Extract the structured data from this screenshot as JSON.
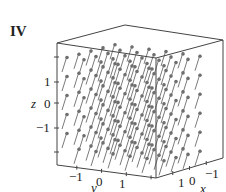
{
  "panel_label": "IV",
  "colors": {
    "edge": "#444444",
    "arrow": "#7a7a7a",
    "text": "#222222"
  },
  "cube": {
    "top_left": [
      57,
      43
    ],
    "top_back": [
      125,
      25
    ],
    "top_right": [
      223,
      40
    ],
    "top_front": [
      156,
      58
    ],
    "bottom_left": [
      57,
      165
    ],
    "bottom_front": [
      156,
      178
    ],
    "bottom_right": [
      223,
      158
    ]
  },
  "axes": {
    "z": {
      "label": "z",
      "label_pos": [
        31,
        108
      ],
      "ticks": [
        {
          "text": "1",
          "pos": [
            44,
            86
          ],
          "y": 82
        },
        {
          "text": "0",
          "pos": [
            44,
            108
          ],
          "y": 103
        },
        {
          "text": "−1",
          "pos": [
            36,
            132
          ],
          "y": 128
        }
      ],
      "extra_ticks_y": [
        57,
        152
      ]
    },
    "y": {
      "label": "y",
      "label_pos": [
        91,
        192
      ],
      "ticks": [
        {
          "text": "−1",
          "pos": [
            69,
            181
          ]
        },
        {
          "text": "0",
          "pos": [
            96,
            186
          ]
        },
        {
          "text": "1",
          "pos": [
            119,
            188
          ]
        }
      ]
    },
    "x": {
      "label": "x",
      "label_pos": [
        200,
        193
      ],
      "ticks": [
        {
          "text": "1",
          "pos": [
            178,
            187
          ]
        },
        {
          "text": "0",
          "pos": [
            189,
            185
          ]
        },
        {
          "text": "−1",
          "pos": [
            205,
            178
          ]
        }
      ]
    }
  },
  "field": {
    "description": "Constant vector field; arrows point up and to the right",
    "arrow_vector": [
      5,
      -16
    ],
    "rows": 7,
    "row_spacing": 17,
    "start_y": 64
  }
}
